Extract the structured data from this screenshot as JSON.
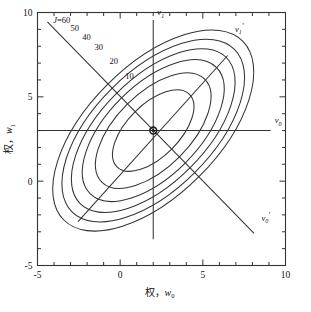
{
  "figure": {
    "background": "#ffffff",
    "line_color": "#333333",
    "frame_color": "#333333",
    "marker_color": "#222222"
  },
  "axes": {
    "x": {
      "title_cjk": "权，",
      "title_var": "w",
      "title_sub": "0",
      "min": -5,
      "max": 10,
      "major_ticks": [
        -5,
        0,
        5,
        10
      ],
      "major_labels": [
        "-5",
        "0",
        "5",
        "10"
      ],
      "minor_step": 1
    },
    "y": {
      "title_cjk": "权，",
      "title_var": "w",
      "title_sub": "1",
      "min": -5,
      "max": 10,
      "major_ticks": [
        -5,
        0,
        5,
        10
      ],
      "major_labels": [
        "-5",
        "0",
        "5",
        "10"
      ],
      "minor_step": 1
    }
  },
  "chart_data": {
    "type": "line",
    "plot_kind": "contour",
    "title": "",
    "xlabel": "权，w0",
    "ylabel": "权，w1",
    "xlim": [
      -5,
      10
    ],
    "ylim": [
      -5,
      10
    ],
    "grid": false,
    "legend": "none",
    "center": {
      "x": 2,
      "y": 3,
      "label": "minimum"
    },
    "ellipse_rotation_deg": -45,
    "contours": [
      {
        "level": 10,
        "label": "10",
        "semi_major": 3.1,
        "semi_minor": 1.55,
        "label_x": 0.3,
        "label_y": 6.05
      },
      {
        "level": 20,
        "label": "20",
        "semi_major": 4.4,
        "semi_minor": 2.2,
        "label_x": -0.65,
        "label_y": 6.95
      },
      {
        "level": 30,
        "label": "30",
        "semi_major": 5.4,
        "semi_minor": 2.7,
        "label_x": -1.55,
        "label_y": 7.75
      },
      {
        "level": 40,
        "label": "40",
        "semi_major": 6.25,
        "semi_minor": 3.1,
        "label_x": -2.3,
        "label_y": 8.35
      },
      {
        "level": 50,
        "label": "50",
        "semi_major": 6.95,
        "semi_minor": 3.5,
        "label_x": -3.0,
        "label_y": 8.9
      },
      {
        "level": 60,
        "label": "J=60",
        "semi_major": 7.65,
        "semi_minor": 3.85,
        "label_x": -4.05,
        "label_y": 9.35
      }
    ],
    "eigen_axes": [
      {
        "name": "v0",
        "label_var": "v",
        "label_sub": "0",
        "prime": false,
        "type": "horizontal",
        "x1": -5,
        "y1": 3,
        "x2": 9.1,
        "y2": 3,
        "label_x": 9.35,
        "label_y": 3.45
      },
      {
        "name": "v1",
        "label_var": "v",
        "label_sub": "1",
        "prime": false,
        "type": "vertical",
        "x1": 2,
        "y1": -3.45,
        "x2": 2,
        "y2": 9.55,
        "label_x": 2.25,
        "label_y": 9.85
      },
      {
        "name": "v1prime",
        "label_var": "v",
        "label_sub": "1",
        "prime": true,
        "type": "diagonal-up",
        "x1": -2.55,
        "y1": -2.4,
        "x2": 6.5,
        "y2": 7.45,
        "label_x": 6.95,
        "label_y": 8.85
      },
      {
        "name": "v0prime",
        "label_var": "v",
        "label_sub": "0",
        "prime": true,
        "type": "diagonal-down",
        "x1": -4.4,
        "y1": 9.45,
        "x2": 8.1,
        "y2": -3.1,
        "label_x": 8.55,
        "label_y": -2.35
      }
    ]
  }
}
